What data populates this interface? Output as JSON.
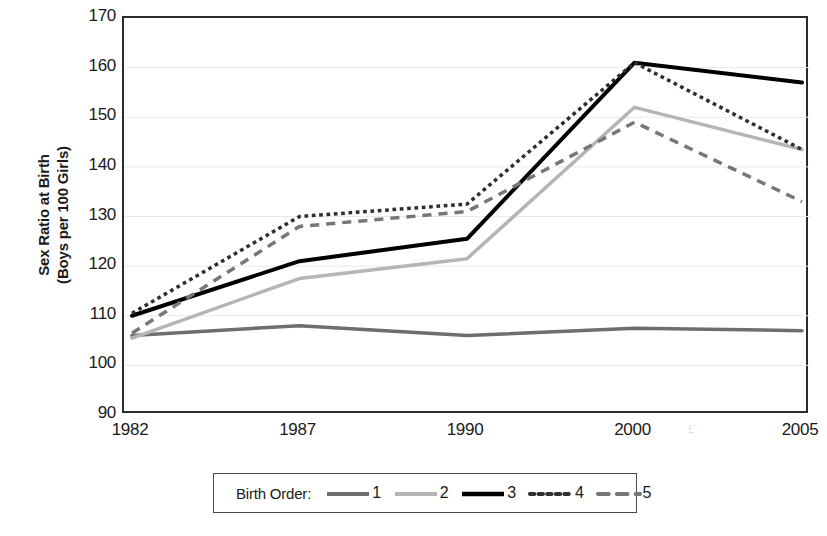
{
  "chart_data": {
    "type": "line",
    "title": "",
    "xlabel": "",
    "ylabel": "Sex Ratio at Birth\n(Boys per 100 Girls)",
    "categories": [
      "1982",
      "1987",
      "1990",
      "2000",
      "2005"
    ],
    "x": [
      1982,
      1987,
      1990,
      2000,
      2005
    ],
    "ylim": [
      90,
      170
    ],
    "y_ticks": [
      170,
      160,
      150,
      140,
      130,
      120,
      110,
      100,
      90
    ],
    "grid": "horizontal",
    "legend_position": "bottom",
    "legend_title": "Birth Order:",
    "series": [
      {
        "name": "1",
        "label": "1",
        "color": "#6e6e6e",
        "style": "solid",
        "width": 3.5,
        "values": [
          106,
          108,
          106,
          107.5,
          107
        ]
      },
      {
        "name": "2",
        "label": "2",
        "color": "#b5b5b5",
        "style": "solid",
        "width": 3.5,
        "values": [
          105.5,
          117.5,
          121.5,
          152,
          143.5
        ]
      },
      {
        "name": "3",
        "label": "3",
        "color": "#000000",
        "style": "solid",
        "width": 4,
        "values": [
          110,
          121,
          125.5,
          161,
          157
        ]
      },
      {
        "name": "4",
        "label": "4",
        "color": "#2e2e2e",
        "style": "dotted",
        "width": 3.5,
        "values": [
          110.5,
          130,
          132.5,
          161,
          143.5
        ]
      },
      {
        "name": "5",
        "label": "5",
        "color": "#777777",
        "style": "dashed",
        "width": 3.5,
        "values": [
          106.5,
          128,
          131,
          149,
          133
        ]
      }
    ]
  },
  "axes": {
    "y_tick_labels": [
      "170",
      "160",
      "150",
      "140",
      "130",
      "120",
      "110",
      "100",
      "90"
    ],
    "x_tick_labels": [
      "1982",
      "1987",
      "1990",
      "2000",
      "2005"
    ],
    "y_title": "Sex Ratio at Birth\n(Boys per 100 Girls)"
  },
  "legend": {
    "title": "Birth Order:",
    "entries": [
      {
        "label": "1"
      },
      {
        "label": "2"
      },
      {
        "label": "3"
      },
      {
        "label": "4"
      },
      {
        "label": "5"
      }
    ]
  },
  "artifact": {
    "text": "£¨"
  }
}
